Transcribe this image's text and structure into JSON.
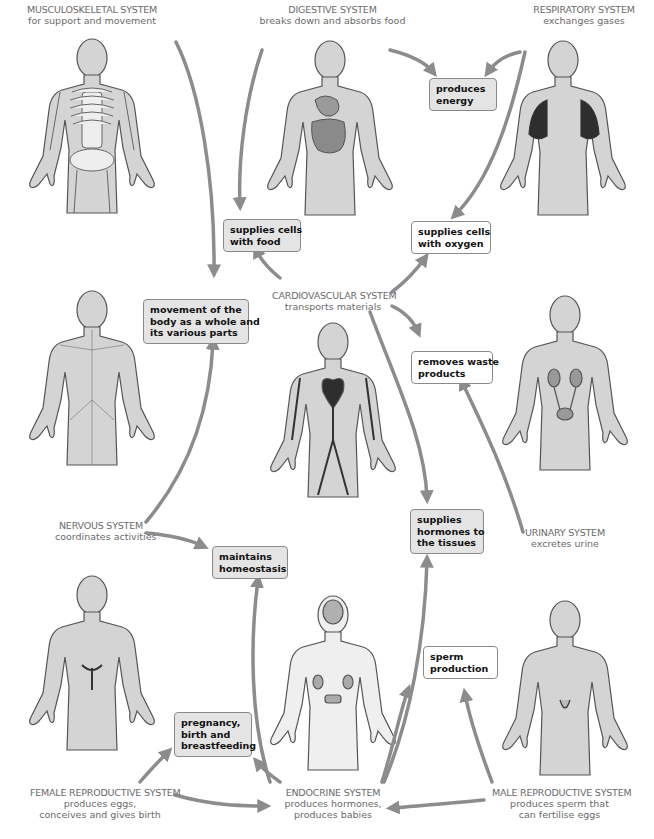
{
  "colors": {
    "arrow": "#8c8c8c",
    "body_fill": "#d4d4d4",
    "body_stroke": "#555555",
    "box_grey": "#e4e4e4",
    "box_white": "#ffffff",
    "label_text": "#6a6a6a",
    "box_text": "#111111"
  },
  "systems": {
    "musculoskeletal": {
      "title": "MUSCULOSKELETAL SYSTEM",
      "desc": [
        "for support and movement"
      ]
    },
    "digestive": {
      "title": "DIGESTIVE SYSTEM",
      "desc": [
        "breaks down and absorbs food"
      ]
    },
    "respiratory": {
      "title": "RESPIRATORY SYSTEM",
      "desc": [
        "exchanges gases"
      ]
    },
    "cardiovascular": {
      "title": "CARDIOVASCULAR SYSTEM",
      "desc": [
        "transports materials"
      ]
    },
    "nervous": {
      "title": "NERVOUS SYSTEM",
      "desc": [
        "coordinates activities"
      ]
    },
    "urinary": {
      "title": "URINARY SYSTEM",
      "desc": [
        "excretes urine"
      ]
    },
    "female_reproductive": {
      "title": "FEMALE REPRODUCTIVE SYSTEM",
      "desc": [
        "produces eggs,",
        "conceives and gives birth"
      ]
    },
    "endocrine": {
      "title": "ENDOCRINE SYSTEM",
      "desc": [
        "produces hormones,",
        "produces babies"
      ]
    },
    "male_reproductive": {
      "title": "MALE REPRODUCTIVE SYSTEM",
      "desc": [
        "produces sperm that",
        "can fertilise eggs"
      ]
    }
  },
  "functions": {
    "produces_energy": [
      "produces",
      "energy"
    ],
    "supplies_cells_food": [
      "supplies cells",
      "with food"
    ],
    "supplies_cells_oxygen": [
      "supplies cells",
      "with oxygen"
    ],
    "movement": [
      "movement of the",
      "body as a whole and",
      "its various parts"
    ],
    "removes_waste": [
      "removes waste",
      "products"
    ],
    "maintains_homeostasis": [
      "maintains",
      "homeostasis"
    ],
    "supplies_hormones": [
      "supplies",
      "hormones to",
      "the tissues"
    ],
    "sperm_production": [
      "sperm",
      "production"
    ],
    "pregnancy": [
      "pregnancy,",
      "birth and",
      "breastfeeding"
    ]
  }
}
